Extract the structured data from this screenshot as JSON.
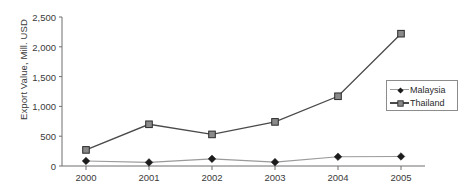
{
  "chart_data": {
    "type": "line",
    "title": "",
    "xlabel": "",
    "ylabel": "Export Value, Mill. USD",
    "categories": [
      "2000",
      "2001",
      "2002",
      "2003",
      "2004",
      "2005"
    ],
    "x": [
      2000,
      2001,
      2002,
      2003,
      2004,
      2005
    ],
    "series": [
      {
        "name": "Malaysia",
        "marker": "diamond",
        "color": "#9a9a9a",
        "marker_color": "#1c1c1c",
        "values": [
          85,
          60,
          120,
          65,
          155,
          160
        ]
      },
      {
        "name": "Thailand",
        "marker": "square",
        "color": "#4a4a4a",
        "marker_color": "#8a8a8a",
        "values": [
          270,
          700,
          530,
          740,
          1170,
          2220
        ]
      }
    ],
    "ylim": [
      0,
      2500
    ],
    "yticks": [
      0,
      500,
      1000,
      1500,
      2000,
      2500
    ],
    "ytick_labels": [
      "0",
      "500",
      "1,000",
      "1,500",
      "2,000",
      "2,500"
    ],
    "grid": false,
    "legend_position": "center right"
  },
  "axis": {
    "y_label": "Export Value, Mill. USD",
    "y_tick_labels": [
      "2,500",
      "2,000",
      "1,500",
      "1,000",
      "500",
      "0"
    ],
    "x_tick_labels": [
      "2000",
      "2001",
      "2002",
      "2003",
      "2004",
      "2005"
    ]
  },
  "legend": {
    "entries": [
      {
        "label": "Malaysia"
      },
      {
        "label": "Thailand"
      }
    ]
  },
  "caption": {
    "text": ""
  },
  "colors": {
    "axis": "#6f6f6f",
    "thailand_line": "#4a4a4a",
    "malaysia_line": "#9a9a9a",
    "legend_border": "#8c8c8c",
    "text": "#3a3a3a"
  }
}
